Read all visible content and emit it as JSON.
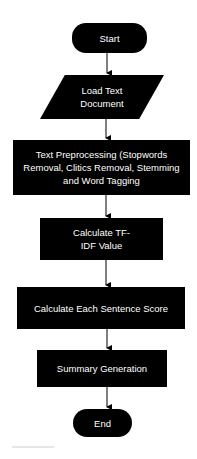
{
  "flowchart": {
    "start": "Start",
    "load": "Load Text Document",
    "preprocess": "Text Preprocessing (Stopwords Removal, Clitics Removal, Stemming and Word Tagging",
    "tfidf": "Calculate TF-IDF Value",
    "sentence_score": "Calculate Each Sentence Score",
    "summary": "Summary Generation",
    "end": "End"
  }
}
